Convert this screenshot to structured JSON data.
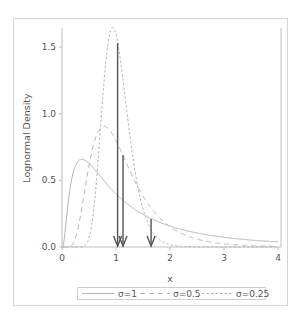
{
  "chart_data": {
    "type": "line",
    "title": "",
    "xlabel": "x",
    "ylabel": "Lognormal Density",
    "xlim": [
      0,
      4
    ],
    "ylim": [
      0,
      1.65
    ],
    "x_ticks": [
      "0",
      "1",
      "2",
      "3",
      "4"
    ],
    "y_ticks": [
      "0.0",
      "0.5",
      "1.0",
      "1.5"
    ],
    "grid": false,
    "legend_position": "bottom",
    "series": [
      {
        "name": "σ=1",
        "mu": 0,
        "sigma": 1,
        "style": "solid",
        "mode_x": 0.368,
        "peak_y": 0.657
      },
      {
        "name": "σ=0.5",
        "mu": 0,
        "sigma": 0.5,
        "style": "long-dash",
        "mode_x": 0.779,
        "peak_y": 0.904
      },
      {
        "name": "σ=0.25",
        "mu": 0,
        "sigma": 0.25,
        "style": "short-dash",
        "mode_x": 0.939,
        "peak_y": 1.646
      }
    ],
    "annotations": [
      {
        "type": "arrow-down",
        "x": 1.03,
        "y_start": 1.53,
        "y_end": 0.0,
        "label": "mean σ=0.25"
      },
      {
        "type": "arrow-down",
        "x": 1.13,
        "y_start": 0.69,
        "y_end": 0.0,
        "label": "mean σ=0.5"
      },
      {
        "type": "arrow-down",
        "x": 1.65,
        "y_start": 0.21,
        "y_end": 0.0,
        "label": "mean σ=1"
      }
    ]
  },
  "legend": {
    "items": [
      "σ=1",
      "σ=0.5",
      "σ=0.25"
    ]
  },
  "colors": {
    "curve": "#b4b4b4",
    "arrow": "#555555",
    "axis": "#bdbdbd",
    "frame": "#d6d6d6",
    "text": "#555555"
  }
}
